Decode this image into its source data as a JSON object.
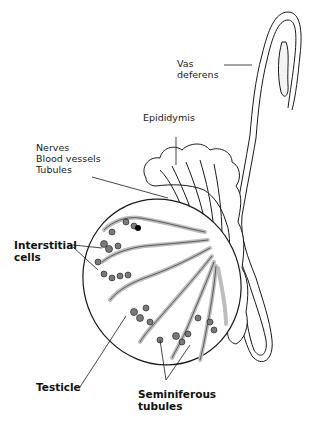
{
  "diagram": {
    "colors": {
      "line": "#1a1a1a",
      "tubule_fill": "#bdbdbd",
      "cell_fill": "#7a7a7a",
      "background": "#ffffff"
    },
    "labels": {
      "vas_deferens": [
        "Vas",
        "deferens"
      ],
      "epididymis": "Epididymis",
      "nerves_group": [
        "Nerves",
        "Blood vessels",
        "Tubules"
      ],
      "interstitial_cells": [
        "Interstitial",
        "cells"
      ],
      "testicle": "Testicle",
      "seminiferous_tubules": [
        "Seminiferous",
        "tubules"
      ]
    }
  }
}
